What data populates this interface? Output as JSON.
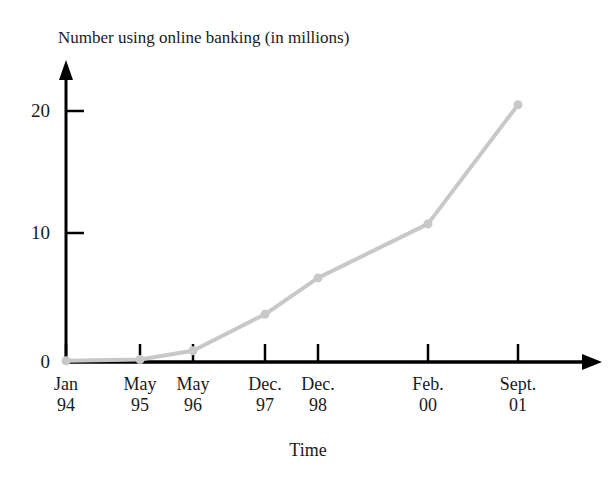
{
  "chart_data": {
    "type": "line",
    "title": "Number using online banking (in millions)",
    "xlabel": "Time",
    "ylabel": "",
    "categories": [
      "Jan 94",
      "May 95",
      "May 96",
      "Dec. 97",
      "Dec. 98",
      "Feb. 00",
      "Sept. 01"
    ],
    "x_tick_labels": [
      {
        "top": "Jan",
        "bottom": "94"
      },
      {
        "top": "May",
        "bottom": "95"
      },
      {
        "top": "May",
        "bottom": "96"
      },
      {
        "top": "Dec.",
        "bottom": "97"
      },
      {
        "top": "Dec.",
        "bottom": "98"
      },
      {
        "top": "Feb.",
        "bottom": "00"
      },
      {
        "top": "Sept.",
        "bottom": "01"
      }
    ],
    "values": [
      0.1,
      0.2,
      0.9,
      3.8,
      6.7,
      11.0,
      20.5
    ],
    "y_tick_labels": [
      "0",
      "10",
      "20"
    ],
    "y_tick_values": [
      0,
      10,
      20
    ],
    "ylim": [
      0,
      23
    ],
    "grid": false,
    "legend": false,
    "series_color": "#c8c8c8",
    "axis_color": "#000000",
    "text_color": "#1a1a1a",
    "background_color": "#ffffff"
  },
  "axis_geometry": {
    "x_pixels": [
      66,
      140,
      193,
      265,
      318,
      428,
      518
    ],
    "y_zero_pixel": 362,
    "y_per_unit_pixels": 12.55,
    "axis_x_pixel": 66,
    "x_axis_end_pixel": 600,
    "y_axis_top_pixel": 62
  }
}
